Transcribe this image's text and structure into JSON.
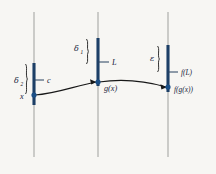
{
  "figure": {
    "background_color": "#f7f6f3",
    "axis_color": "#a8a8a4",
    "bar_color": "#1d3f66",
    "dot_color": "#1b4f87",
    "curve_color": "#181818",
    "text_color": "#15213a"
  },
  "axes": [
    {
      "name": "domain-axis",
      "x": 34,
      "y_top": 12,
      "y_bottom": 157
    },
    {
      "name": "intermediate-axis",
      "x": 98,
      "y_top": 12,
      "y_bottom": 157
    },
    {
      "name": "range-axis",
      "x": 168,
      "y_top": 12,
      "y_bottom": 157
    }
  ],
  "bars": [
    {
      "name": "delta2-interval-bar",
      "x": 34,
      "y_top": 63,
      "y_bottom": 105
    },
    {
      "name": "delta1-interval-bar",
      "x": 98,
      "y_top": 38,
      "y_bottom": 86
    },
    {
      "name": "epsilon-interval-bar",
      "x": 168,
      "y_top": 45,
      "y_bottom": 92
    }
  ],
  "points": [
    {
      "name": "x-point",
      "label": "x",
      "x": 34,
      "y": 95,
      "label_x": 20,
      "label_y": 99
    },
    {
      "name": "gx-point",
      "label": "g(x)",
      "x": 98,
      "y": 82,
      "label_x": 104,
      "label_y": 91
    },
    {
      "name": "fgx-point",
      "label": "f(g(x))",
      "x": 168,
      "y": 87,
      "label_x": 174,
      "label_y": 92
    }
  ],
  "ticks": [
    {
      "name": "c-tick",
      "label": "c",
      "x1": 34,
      "x2": 44,
      "y": 80,
      "label_x": 47,
      "label_y": 83
    },
    {
      "name": "L-tick",
      "label": "L",
      "x1": 98,
      "x2": 109,
      "y": 62,
      "label_x": 112,
      "label_y": 65
    },
    {
      "name": "fL-tick",
      "label": "f(L)",
      "x1": 168,
      "x2": 178,
      "y": 72,
      "label_x": 181,
      "label_y": 75
    }
  ],
  "braces": [
    {
      "name": "delta2-brace",
      "symbol": "δ",
      "subscript": "2",
      "symbol_x": 14,
      "symbol_y": 83,
      "sub_x": 21,
      "sub_y": 85,
      "brace_x": 27,
      "brace_top": 64,
      "brace_bottom": 94
    },
    {
      "name": "delta1-brace",
      "symbol": "δ",
      "subscript": "1",
      "symbol_x": 74,
      "symbol_y": 51,
      "sub_x": 81,
      "sub_y": 53,
      "brace_x": 88,
      "brace_top": 39,
      "brace_bottom": 64
    },
    {
      "name": "epsilon-brace",
      "symbol": "ε",
      "subscript": "",
      "symbol_x": 150,
      "symbol_y": 60,
      "sub_x": 0,
      "sub_y": 0,
      "brace_x": 159,
      "brace_top": 46,
      "brace_bottom": 72
    }
  ],
  "curve": {
    "name": "function-curve",
    "path": "M 35 95 C 55 94, 75 86, 96 82",
    "path2": "M 99 82 C 120 79, 142 80, 166 87",
    "arrow1": "M 96 82 L 90 79.5 L 91 84.3 Z",
    "arrow2": "M 166.5 87 L 160.6 84.6 L 161.6 89.4 Z"
  }
}
